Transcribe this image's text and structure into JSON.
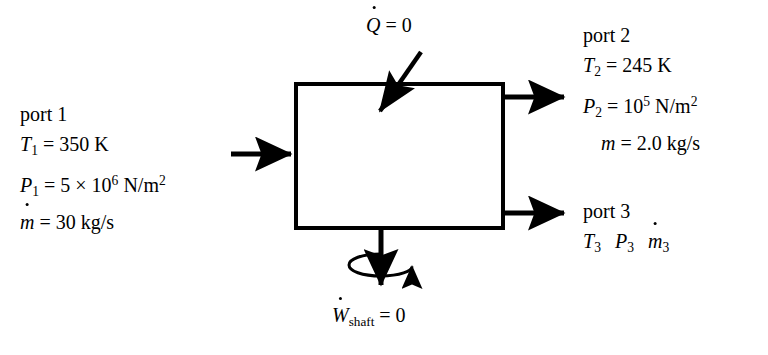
{
  "figure": {
    "type": "control-volume-diagram",
    "background_color": "#ffffff",
    "line_color": "#000000"
  },
  "control_volume": {
    "name": "control-volume-box",
    "x": 296,
    "y": 84,
    "width": 207,
    "height": 144,
    "stroke_width": 4
  },
  "heat": {
    "label_parts": {
      "symbol": "Q",
      "equals": "= 0"
    },
    "label_text": "Q̇ = 0",
    "value": 0,
    "arrow": {
      "from": [
        421,
        52
      ],
      "to": [
        377,
        116
      ],
      "direction": "into-box-diagonal"
    }
  },
  "work": {
    "label_parts": {
      "symbol": "W",
      "subscript": "shaft",
      "equals": "= 0"
    },
    "label_text": "Ẇshaft = 0",
    "value": 0,
    "shaft": {
      "from": [
        381,
        228
      ],
      "to": [
        381,
        292
      ],
      "rotation_indicator": true
    }
  },
  "ports": [
    {
      "id": "port1",
      "title": "port 1",
      "side": "left",
      "arrow": {
        "from": [
          231,
          154
        ],
        "to": [
          297,
          154
        ],
        "direction": "into-box"
      },
      "lines": [
        {
          "symbol": "T",
          "sub": "1",
          "value": "= 350 K"
        },
        {
          "symbol": "P",
          "sub": "1",
          "value": "= 5 × 10",
          "exponent": "6",
          "units": "N/m",
          "units_exp": "2"
        },
        {
          "symbol": "m",
          "dot": true,
          "value": "= 30 kg/s"
        }
      ]
    },
    {
      "id": "port2",
      "title": "port 2",
      "side": "right-top",
      "arrow": {
        "from": [
          503,
          97
        ],
        "to": [
          570,
          97
        ],
        "direction": "out-of-box"
      },
      "lines": [
        {
          "symbol": "T",
          "sub": "2",
          "value": "= 245 K"
        },
        {
          "symbol": "P",
          "sub": "2",
          "value": "= 10",
          "exponent": "5",
          "units": "N/m",
          "units_exp": "2"
        },
        {
          "symbol": "m",
          "dot": false,
          "value": "= 2.0 kg/s",
          "indent": true
        }
      ]
    },
    {
      "id": "port3",
      "title": "port 3",
      "side": "right-bottom",
      "arrow": {
        "from": [
          503,
          213
        ],
        "to": [
          570,
          213
        ],
        "direction": "out-of-box"
      },
      "lines": [
        {
          "symbols": [
            "T",
            "P",
            "m"
          ],
          "subs": [
            "3",
            "3",
            "3"
          ],
          "unknown": true
        }
      ]
    }
  ],
  "text": {
    "port1": {
      "title": "port 1",
      "T": "T",
      "T_sub": "1",
      "T_val": "= 350 K",
      "P": "P",
      "P_sub": "1",
      "P_val": "= 5 × 10",
      "P_exp": "6",
      "P_units": "N/m",
      "P_units_exp": "2",
      "m": "m",
      "m_val": "= 30 kg/s"
    },
    "port2": {
      "title": "port 2",
      "T": "T",
      "T_sub": "2",
      "T_val": "= 245 K",
      "P": "P",
      "P_sub": "2",
      "P_val": "= 10",
      "P_exp": "5",
      "P_units": "N/m",
      "P_units_exp": "2",
      "m": "m",
      "m_val": "= 2.0 kg/s"
    },
    "port3": {
      "title": "port 3",
      "T": "T",
      "T_sub": "3",
      "P": "P",
      "P_sub": "3",
      "m": "m",
      "m_sub": "3"
    },
    "heat": {
      "symbol": "Q",
      "value": "= 0"
    },
    "work": {
      "symbol": "W",
      "subscript": "shaft",
      "value": "= 0"
    }
  }
}
